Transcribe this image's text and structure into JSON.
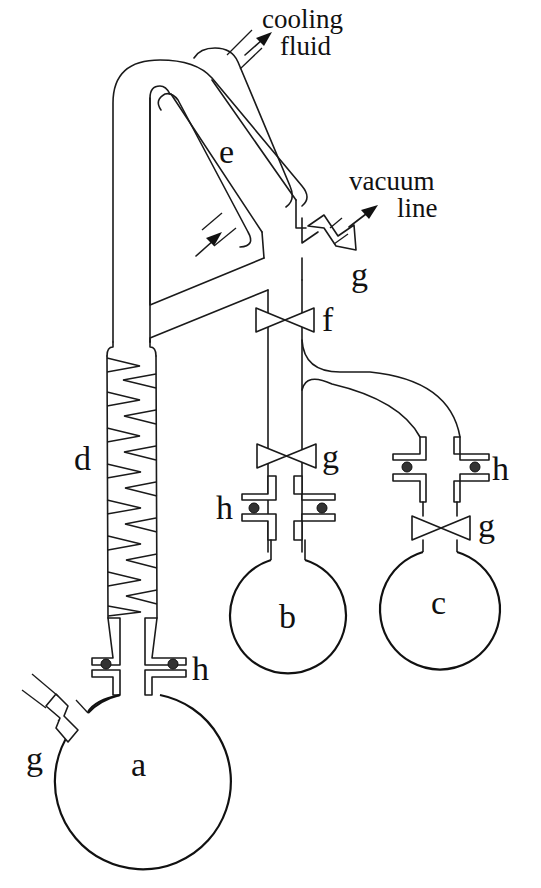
{
  "diagram": {
    "type": "laboratory apparatus schematic",
    "components": {
      "flask_a": {
        "label": "a",
        "description": "boiling flask"
      },
      "flask_b": {
        "label": "b",
        "description": "receiver flask"
      },
      "flask_c": {
        "label": "c",
        "description": "receiver flask"
      },
      "column_d": {
        "label": "d",
        "description": "Vigreux-type fractionating column"
      },
      "condenser_e": {
        "label": "e",
        "description": "condenser"
      },
      "valve_f": {
        "label": "f",
        "description": "stopcock"
      },
      "valve_g": {
        "label": "g",
        "description": "stopcock"
      },
      "joint_h": {
        "label": "h",
        "description": "O-ring joint"
      }
    },
    "annotations": {
      "cooling_line1": "cooling",
      "cooling_line2": "fluid",
      "vacuum_line1": "vacuum",
      "vacuum_line2": "line"
    },
    "colors": {
      "line": "#1a1a1a",
      "background": "#ffffff"
    }
  }
}
